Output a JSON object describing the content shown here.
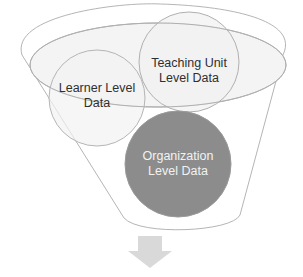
{
  "diagram": {
    "type": "funnel",
    "elements": {
      "learner": {
        "label": "Learner Level\nData"
      },
      "teaching": {
        "label": "Teaching Unit\nLevel  Data"
      },
      "organization": {
        "label": "Organization\nLevel Data"
      }
    },
    "arrow": {
      "direction": "down"
    }
  },
  "colors": {
    "outline": "#b8b8b8",
    "circle_fill": "#f3f3f3",
    "organization_fill": "#8c8c8c",
    "arrow_fill": "#d9d9d9",
    "text_dark": "#2f2f2f",
    "text_light": "#f2f2f2"
  }
}
